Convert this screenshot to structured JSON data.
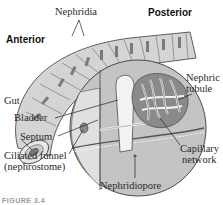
{
  "diagram": {
    "labels": {
      "nephridia": "Nephridia",
      "posterior": "Posterior",
      "anterior": "Anterior",
      "nephric_tubule_line1": "Nephric",
      "nephric_tubule_line2": "tubule",
      "gut": "Gut",
      "bladder": "Bladder",
      "septum": "Septum",
      "ciliated_funnel_line1": "Ciliated funnel",
      "ciliated_funnel_line2": "(nephrostome)",
      "capillary_line1": "Capillary",
      "capillary_line2": "network",
      "nephridiopore": "Nephridiopore"
    },
    "caption": "FIGURE 3.4",
    "colors": {
      "body_fill": "#c9c9c9",
      "body_dark": "#9a9a9a",
      "outline": "#3a3a3a",
      "tubule": "#f4f4f4",
      "background": "#ffffff"
    }
  }
}
